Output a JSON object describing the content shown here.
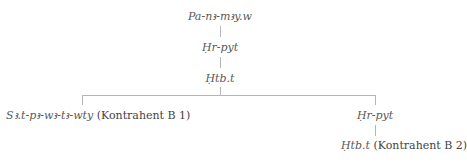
{
  "tree": {
    "root": {
      "name": "Pa-nꜣ-mꜣy.w"
    },
    "level1": {
      "name": "Ḥr-pyt"
    },
    "level2": {
      "name": "Ḥtb.t"
    },
    "children": [
      {
        "name": "Sꜣ.t-pꜣ-wꜣ-tꜣ-wty",
        "role": "(Kontrahent B 1)"
      },
      {
        "name": "Ḥr-pyt",
        "child": {
          "name": "Ḥtb.t",
          "role": "(Kontrahent B 2)"
        }
      }
    ]
  },
  "colors": {
    "line": "#b5b5b5",
    "text": "#4a4a4a"
  }
}
